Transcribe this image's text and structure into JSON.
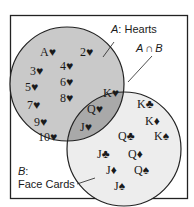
{
  "diagram": {
    "type": "venn",
    "colors": {
      "background": "#ffffff",
      "frame": "#222222",
      "set_a_fill": "#c9c9c9",
      "set_b_fill": "#ededed",
      "intersection_fill": "#a9a9a9",
      "outline": "#222222",
      "text": "#1a1a1a"
    },
    "set_a": {
      "letter": "A",
      "name": ": Hearts",
      "only_items": [
        "A♥",
        "2♥",
        "3♥",
        "4♥",
        "5♥",
        "6♥",
        "7♥",
        "8♥",
        "9♥",
        "10♥"
      ]
    },
    "set_b": {
      "letter": "B",
      "colon": ":",
      "name": "Face Cards",
      "only_items": [
        "K♣",
        "K♦",
        "Q♣",
        "K♠",
        "J♣",
        "Q♦",
        "J♦",
        "Q♠",
        "J♠"
      ]
    },
    "intersection": {
      "label_a": "A",
      "label_op": "∩",
      "label_b": "B",
      "items": [
        "K♥",
        "Q♥",
        "J♥"
      ]
    }
  }
}
